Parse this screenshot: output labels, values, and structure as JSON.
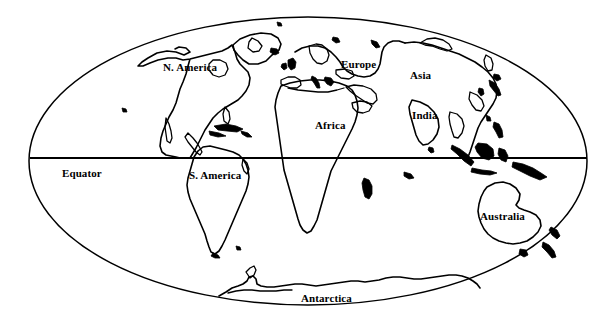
{
  "map": {
    "title": "World Map",
    "projection": "oval / Mollweide-style world outline",
    "style": "black and white line drawing, no fill",
    "background_color": "#ffffff",
    "line_color": "#000000",
    "frame": {
      "shape": "ellipse",
      "center_x": 308,
      "center_y": 161,
      "radius_x": 279,
      "radius_y": 144
    },
    "equator": {
      "label": "Equator",
      "y": 158,
      "x_start": 30,
      "x_end": 587
    },
    "labels": [
      {
        "id": "n-america",
        "text": "N. America",
        "x": 163,
        "y": 62
      },
      {
        "id": "europe",
        "text": "Europe",
        "x": 341,
        "y": 59
      },
      {
        "id": "asia",
        "text": "Asia",
        "x": 410,
        "y": 70
      },
      {
        "id": "india",
        "text": "India",
        "x": 412,
        "y": 110
      },
      {
        "id": "africa",
        "text": "Africa",
        "x": 315,
        "y": 120
      },
      {
        "id": "equator",
        "text": "Equator",
        "x": 62,
        "y": 168
      },
      {
        "id": "s-america",
        "text": "S. America",
        "x": 189,
        "y": 170
      },
      {
        "id": "australia",
        "text": "Australia",
        "x": 480,
        "y": 211
      },
      {
        "id": "antarctica",
        "text": "Antarctica",
        "x": 301,
        "y": 293
      }
    ],
    "continents": [
      "N. America",
      "S. America",
      "Europe",
      "Africa",
      "Asia",
      "India",
      "Australia",
      "Antarctica"
    ]
  }
}
